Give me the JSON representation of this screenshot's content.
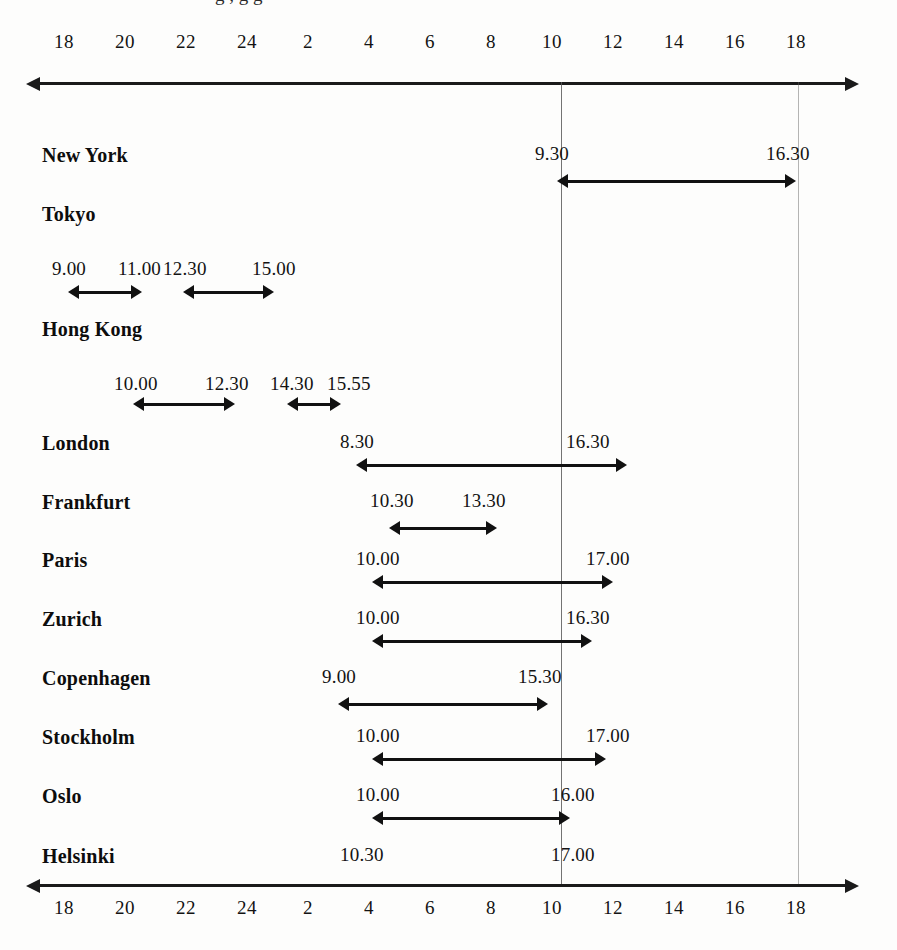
{
  "chart_data": {
    "type": "bar",
    "xlabel": "",
    "ylabel": "",
    "grid": false,
    "legend_position": "none",
    "axis": {
      "tick_labels": [
        "18",
        "20",
        "22",
        "24",
        "2",
        "4",
        "6",
        "8",
        "10",
        "12",
        "14",
        "16",
        "18"
      ],
      "tick_x": [
        64,
        125,
        186,
        247,
        308,
        369,
        430,
        491,
        552,
        613,
        674,
        735,
        796
      ],
      "range_start_hour": 18,
      "range_end_hour": 18,
      "top_axis_y": 82,
      "bottom_axis_y": 884,
      "line_left_x": 38,
      "line_right_x": 845,
      "arrowheads": "both"
    },
    "reference_lines": [
      {
        "name": "gmt-10-line",
        "x": 561,
        "from_y": 82,
        "to_y": 884
      },
      {
        "name": "gmt-17-line",
        "x": 798,
        "from_y": 82,
        "to_y": 884
      }
    ],
    "categories": [
      "New York",
      "Tokyo",
      "Hong Kong",
      "London",
      "Frankfurt",
      "Paris",
      "Zurich",
      "Copenhagen",
      "Stockholm",
      "Oslo",
      "Helsinki"
    ],
    "rows": [
      {
        "city": "New York",
        "label_x": 42,
        "label_y": 144,
        "sessions": [
          {
            "open": "9.30",
            "close": "16.30",
            "x1": 557,
            "x2": 796,
            "bar_y": 174,
            "open_label_x": 535,
            "close_label_x": 766,
            "label_y": 143
          }
        ]
      },
      {
        "city": "Tokyo",
        "label_x": 42,
        "label_y": 203,
        "sessions": [
          {
            "open": "9.00",
            "close": "11.00",
            "x1": 68,
            "x2": 142,
            "bar_y": 285,
            "open_label_x": 52,
            "close_label_x": 118,
            "label_y": 258
          },
          {
            "open": "12.30",
            "close": "15.00",
            "x1": 183,
            "x2": 274,
            "bar_y": 285,
            "open_label_x": 163,
            "close_label_x": 252,
            "label_y": 258
          }
        ]
      },
      {
        "city": "Hong Kong",
        "label_x": 42,
        "label_y": 318,
        "sessions": [
          {
            "open": "10.00",
            "close": "12.30",
            "x1": 133,
            "x2": 235,
            "bar_y": 397,
            "open_label_x": 114,
            "close_label_x": 205,
            "label_y": 373
          },
          {
            "open": "14.30",
            "close": "15.55",
            "x1": 287,
            "x2": 341,
            "bar_y": 397,
            "open_label_x": 270,
            "close_label_x": 327,
            "label_y": 373
          }
        ]
      },
      {
        "city": "London",
        "label_x": 42,
        "label_y": 432,
        "sessions": [
          {
            "open": "8.30",
            "close": "16.30",
            "x1": 356,
            "x2": 627,
            "bar_y": 458,
            "open_label_x": 340,
            "close_label_x": 566,
            "label_y": 431
          }
        ]
      },
      {
        "city": "Frankfurt",
        "label_x": 42,
        "label_y": 491,
        "sessions": [
          {
            "open": "10.30",
            "close": "13.30",
            "x1": 389,
            "x2": 497,
            "bar_y": 521,
            "open_label_x": 370,
            "close_label_x": 462,
            "label_y": 490
          }
        ]
      },
      {
        "city": "Paris",
        "label_x": 42,
        "label_y": 549,
        "sessions": [
          {
            "open": "10.00",
            "close": "17.00",
            "x1": 372,
            "x2": 613,
            "bar_y": 575,
            "open_label_x": 356,
            "close_label_x": 586,
            "label_y": 548
          }
        ]
      },
      {
        "city": "Zurich",
        "label_x": 42,
        "label_y": 608,
        "sessions": [
          {
            "open": "10.00",
            "close": "16.30",
            "x1": 372,
            "x2": 592,
            "bar_y": 634,
            "open_label_x": 356,
            "close_label_x": 566,
            "label_y": 607
          }
        ]
      },
      {
        "city": "Copenhagen",
        "label_x": 42,
        "label_y": 667,
        "sessions": [
          {
            "open": "9.00",
            "close": "15.30",
            "x1": 338,
            "x2": 548,
            "bar_y": 697,
            "open_label_x": 322,
            "close_label_x": 518,
            "label_y": 666
          }
        ]
      },
      {
        "city": "Stockholm",
        "label_x": 42,
        "label_y": 726,
        "sessions": [
          {
            "open": "10.00",
            "close": "17.00",
            "x1": 372,
            "x2": 606,
            "bar_y": 752,
            "open_label_x": 356,
            "close_label_x": 586,
            "label_y": 725
          }
        ]
      },
      {
        "city": "Oslo",
        "label_x": 42,
        "label_y": 785,
        "sessions": [
          {
            "open": "10.00",
            "close": "16.00",
            "x1": 372,
            "x2": 570,
            "bar_y": 811,
            "open_label_x": 356,
            "close_label_x": 551,
            "label_y": 784
          }
        ]
      },
      {
        "city": "Helsinki",
        "label_x": 42,
        "label_y": 845,
        "sessions": [
          {
            "open": "10.30",
            "close": "17.00",
            "x1": 0,
            "x2": 0,
            "bar_y": 0,
            "open_label_x": 340,
            "close_label_x": 551,
            "label_y": 844
          }
        ]
      }
    ]
  },
  "top_cropped_text": "clipped heading descenders"
}
